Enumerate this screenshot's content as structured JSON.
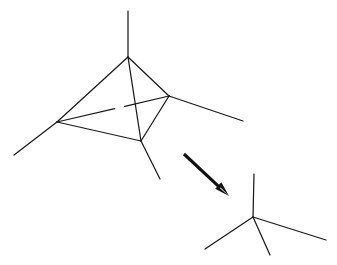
{
  "figure": {
    "background_color": "#ffffff",
    "stroke_color": "#1a1a1a",
    "arrow_color": "#111111",
    "width": 337,
    "height": 265
  },
  "left_structure": {
    "name": "tetrahedral-cluster",
    "description": "Tetrahedron drawn in perspective with four vertices, six connecting edges and one terminal bond projecting from each vertex",
    "vertices": [
      {
        "id": "top",
        "label": "apex-vertex",
        "x": 128,
        "y": 57
      },
      {
        "id": "left",
        "label": "left-vertex",
        "x": 57,
        "y": 122
      },
      {
        "id": "right",
        "label": "right-vertex",
        "x": 169,
        "y": 96
      },
      {
        "id": "bottom",
        "label": "front-vertex",
        "x": 141,
        "y": 141
      }
    ],
    "edges": [
      {
        "from": "top",
        "to": "left",
        "hidden": false
      },
      {
        "from": "top",
        "to": "right",
        "hidden": false
      },
      {
        "from": "top",
        "to": "bottom",
        "hidden": false
      },
      {
        "from": "left",
        "to": "bottom",
        "hidden": false
      },
      {
        "from": "right",
        "to": "bottom",
        "hidden": false
      },
      {
        "from": "left",
        "to": "right",
        "hidden": true
      }
    ],
    "terminal_bonds": [
      {
        "from": "top",
        "x1": 128,
        "y1": 57,
        "x2": 128,
        "y2": 11
      },
      {
        "from": "left",
        "x1": 57,
        "y1": 122,
        "x2": 14,
        "y2": 155
      },
      {
        "from": "right",
        "x1": 169,
        "y1": 96,
        "x2": 243,
        "y2": 121
      },
      {
        "from": "bottom",
        "x1": 141,
        "y1": 141,
        "x2": 160,
        "y2": 179
      }
    ]
  },
  "arrow": {
    "name": "transformation-arrow",
    "label": "reaction arrow pointing down-right",
    "start": {
      "x": 184,
      "y": 154
    },
    "end": {
      "x": 229,
      "y": 196
    },
    "direction": "down-right"
  },
  "right_structure": {
    "name": "tetrahedral-center",
    "description": "Single tetrahedral center with four terminal bonds",
    "center": {
      "id": "center",
      "label": "central-vertex",
      "x": 253,
      "y": 217
    },
    "terminal_bonds": [
      {
        "id": "up",
        "x1": 253,
        "y1": 217,
        "x2": 254,
        "y2": 174
      },
      {
        "id": "right",
        "x1": 253,
        "y1": 217,
        "x2": 326,
        "y2": 240
      },
      {
        "id": "lower-left",
        "x1": 253,
        "y1": 217,
        "x2": 205,
        "y2": 249
      },
      {
        "id": "lower-mid",
        "x1": 253,
        "y1": 217,
        "x2": 270,
        "y2": 255
      }
    ]
  }
}
